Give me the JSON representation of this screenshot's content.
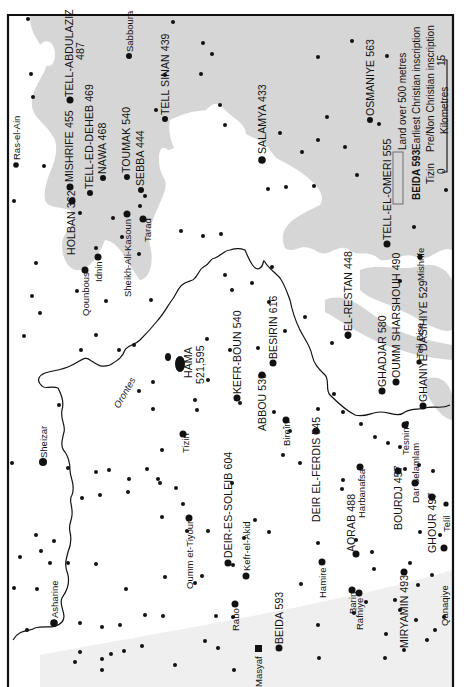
{
  "map": {
    "orientation": "rotated -90deg (text reads bottom-to-top)",
    "colors": {
      "background": "#ffffff",
      "upland": "#d6d6d6",
      "frame": "#111111",
      "ink": "#111111"
    },
    "river": {
      "name": "Orontes",
      "label": "Orontes"
    },
    "legend": {
      "upland_label": "Land over  500 metres",
      "christian_example": "BEIDA 593",
      "christian_label": "Earliest Christian inscription",
      "pagan_example": "Tizin",
      "pagan_label": "Pre/Non Christian inscription",
      "scale": {
        "unit": "Kilometres",
        "min": "0",
        "max": "15"
      }
    },
    "sites_christian": [
      {
        "name": "TELL-ABDULAZIZ",
        "date": "487"
      },
      {
        "name": "MISHRIFE",
        "date": "455"
      },
      {
        "name": "TELL-ED-DEHEB",
        "date": "469"
      },
      {
        "name": "NAWA",
        "date": "468"
      },
      {
        "name": "TOUMAK",
        "date": "540"
      },
      {
        "name": "SEBBA",
        "date": "444"
      },
      {
        "name": "HOLBAN",
        "date": "362"
      },
      {
        "name": "TELL SINAN",
        "date": "439"
      },
      {
        "name": "SALAMYA",
        "date": "433"
      },
      {
        "name": "OSMANIYE",
        "date": "563"
      },
      {
        "name": "TELL-EL-OMERI",
        "date": "555"
      },
      {
        "name": "HAMA",
        "date": "521,595"
      },
      {
        "name": "KEFR-BOUN",
        "date": "540"
      },
      {
        "name": "BESIRIN",
        "date": "616"
      },
      {
        "name": "ABBOU",
        "date": "539"
      },
      {
        "name": "EL-RESTAN",
        "date": "448"
      },
      {
        "name": "GHADJAR",
        "date": "580"
      },
      {
        "name": "OUMM SHARSHOUH",
        "date": "490"
      },
      {
        "name": "GHANIYE",
        "date": ""
      },
      {
        "name": "DASIHIYE",
        "date": "529"
      },
      {
        "name": "DEIR-ES-SOLEIB",
        "date": "604"
      },
      {
        "name": "DEIR EL-FERDIS",
        "date": "545"
      },
      {
        "name": "AQRAB",
        "date": "488"
      },
      {
        "name": "BOURDJ",
        "date": "457"
      },
      {
        "name": "GHOUR",
        "date": "497"
      },
      {
        "name": "MIRYAMIN",
        "date": "493"
      },
      {
        "name": "BEIDA",
        "date": "593"
      }
    ],
    "sites_other": [
      "Ras-el-Ain",
      "Sabboura",
      "Qounbous",
      "Idnin",
      "Sheikh-Ali-Kasoun",
      "Tarad",
      "Mishrife",
      "Teli Bise",
      "Sheizar",
      "Tizin",
      "Bireîn",
      "Oumm et-Tiyour",
      "Kefr-el-Akid",
      "Harbanafsa",
      "Tesnin",
      "Dar Selamlam",
      "Telil",
      "Hamire",
      "Barin",
      "Rafniye",
      "Qanaqiye",
      "Rabo",
      "Masyaf",
      "Asharine"
    ]
  },
  "labels": {
    "tell_abdulaziz_1": "TELL-ABDULAZIZ",
    "tell_abdulaziz_2": "487",
    "ras_el_ain": "Ras-el-Ain",
    "sabboura": "Sabboura",
    "mishrife455": "MISHRIFE 455",
    "tell_ed_deheb": "TELL-ED-DEHEB 469",
    "nawa": "NAWA 468",
    "toumak": "TOUMAK 540",
    "sebba": "SEBBA 444",
    "holban": "HOLBAN 362",
    "tell_sinan": "TELL SINAN 439",
    "salamya": "SALAMYA 433",
    "osmaniye": "OSMANIYE 563",
    "tell_el_omeri": "TELL-EL-OMERI 555",
    "qounbous": "Qounbous",
    "idnin": "Idnin",
    "sheikh_ali": "Sheikh-Ali-Kasoun",
    "tarad": "Tarad",
    "mishrife_small": "Mishrife",
    "hama_1": "HAMA",
    "hama_2": "521,595",
    "kefr_boun": "KEFR-BOUN 540",
    "besirin": "BESIRIN 616",
    "abbou": "ABBOU 539",
    "el_restan": "EL-RESTAN 448",
    "ghadjar": "GHADJAR 580",
    "oumm_sharshouh": "OUMM  SHARSHOUH 490",
    "teli_bise": "Teli Bise",
    "ghaniye_dasihiye": "GHANIYE  DASIHIYE 529",
    "orontes": "Orontes",
    "sheizar": "Sheizar",
    "tizin": "Tizin",
    "birein": "Bireîn",
    "oumm_tiyour": "Oumm et-Tiyour",
    "deir_soleib": "DEIR-ES-SOLEIB 604",
    "kefr_akid": "Kefr-el-Akid",
    "deir_ferdis": "DEIR EL-FERDIS 545",
    "harbanafsa": "Harbanafsa",
    "tesnin": "Tesnin",
    "dar_selamlam": "Dar Selamlam",
    "aqrab": "AQRAB 488",
    "bourdj": "BOURDJ 457",
    "ghour": "GHOUR 497",
    "telil": "Telil",
    "hamire": "Hamire",
    "barin": "Barin",
    "rafniye": "Rafniye",
    "miryamin": "MIRYAMIN 493",
    "qanaqiye": "Qanaqiye",
    "rabo": "Rabo",
    "masyaf": "Masyaf",
    "beida": "BEIDA 593",
    "asharine": "Asharine"
  }
}
